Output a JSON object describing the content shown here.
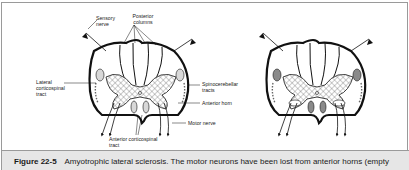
{
  "figure": {
    "number": "Figure 22-5",
    "caption": "Amyotrophic lateral sclerosis. The motor neurons have been lost from anterior horns (empty"
  },
  "diagram": {
    "panels": [
      {
        "name": "normal-spinal-cord",
        "labels": {
          "sensory_nerve": "Sensory nerve",
          "posterior_columns": "Posterior columns",
          "lateral_corticospinal_tract": "Lateral corticospinal tract",
          "spinocerebellar_tracts": "Spinocerebellar tracts",
          "anterior_horn": "Anterior horn",
          "motor_nerve": "Motor nerve",
          "anterior_corticospinal_tract": "Anterior corticospinal tract"
        }
      },
      {
        "name": "als-spinal-cord",
        "labels": {}
      }
    ],
    "colors": {
      "outline": "#111111",
      "hatch": "#555555",
      "tract_fill": "#d8d8d8",
      "degenerated_tract_fill": "#8a8a8a"
    }
  }
}
